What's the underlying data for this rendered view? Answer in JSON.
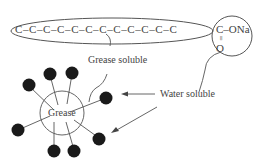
{
  "chain": {
    "hydrocarbon": "C–C–C–C–C–C–C–C–C–C–C–C",
    "carboxyl_c": "C–ONa",
    "double_bond": "=",
    "oxygen": "O"
  },
  "labels": {
    "grease_soluble": "Grease soluble",
    "water_soluble": "Water soluble",
    "grease": "Grease"
  }
}
